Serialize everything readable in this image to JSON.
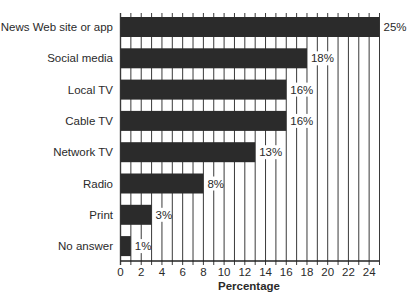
{
  "chart_data": {
    "type": "bar",
    "orientation": "horizontal",
    "title": "",
    "xlabel": "Percentage",
    "ylabel": "",
    "categories": [
      "News Web site or app",
      "Social media",
      "Local TV",
      "Cable TV",
      "Network TV",
      "Radio",
      "Print",
      "No answer"
    ],
    "values": [
      25,
      18,
      16,
      16,
      13,
      8,
      3,
      1
    ],
    "value_labels": [
      "25%",
      "18%",
      "16%",
      "16%",
      "13%",
      "8%",
      "3%",
      "1%"
    ],
    "xlim": [
      0,
      25
    ],
    "xticks": [
      0,
      2,
      4,
      6,
      8,
      10,
      12,
      14,
      16,
      18,
      20,
      22,
      24
    ],
    "grid": "vertical lines at every 1 unit",
    "legend": null,
    "colors": {
      "bar": "#2b2b2b",
      "grid": "#3a3a3a",
      "text": "#2a2a2a",
      "background": "#ffffff"
    }
  }
}
